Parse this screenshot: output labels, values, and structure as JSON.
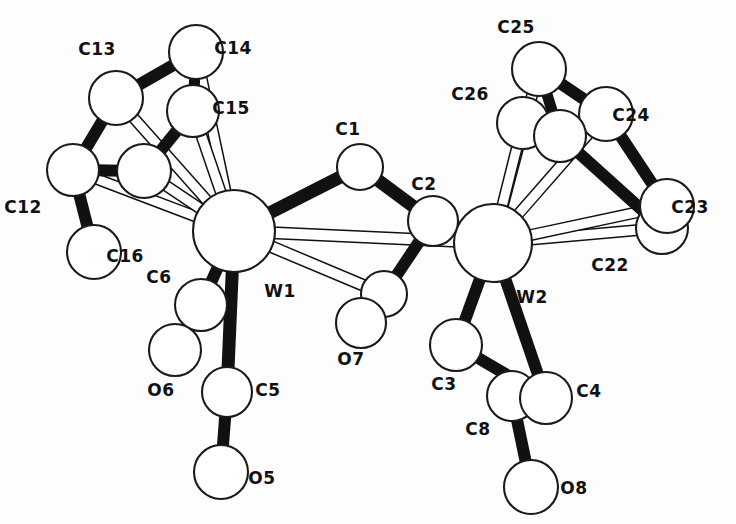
{
  "figure": {
    "background_color": "#fdfdfd",
    "line_color": "#111111",
    "atom_fill_color": "#ffffff",
    "width": 736,
    "height": 524
  },
  "chart_data": {
    "type": "diagram",
    "title": "",
    "atoms": [
      {
        "id": "W1",
        "label": "W1",
        "x": 234,
        "y": 231,
        "r": 41,
        "label_x": 280,
        "label_y": 297,
        "element": "W"
      },
      {
        "id": "W2",
        "label": "W2",
        "x": 493,
        "y": 243,
        "r": 39,
        "label_x": 532,
        "label_y": 303,
        "element": "W"
      },
      {
        "id": "C1",
        "label": "C1",
        "x": 360,
        "y": 167,
        "r": 23,
        "label_x": 348,
        "label_y": 135,
        "element": "C"
      },
      {
        "id": "C2",
        "label": "C2",
        "x": 433,
        "y": 221,
        "r": 25,
        "label_x": 424,
        "label_y": 190,
        "element": "C"
      },
      {
        "id": "C7",
        "label": "",
        "x": 384,
        "y": 294,
        "r": 23,
        "label_x": 0,
        "label_y": 0,
        "element": "C"
      },
      {
        "id": "O7",
        "label": "O7",
        "x": 361,
        "y": 323,
        "r": 25,
        "label_x": 351,
        "label_y": 365,
        "element": "O"
      },
      {
        "id": "C5",
        "label": "C5",
        "x": 227,
        "y": 392,
        "r": 25,
        "label_x": 268,
        "label_y": 396,
        "element": "C"
      },
      {
        "id": "O5",
        "label": "O5",
        "x": 221,
        "y": 472,
        "r": 27,
        "label_x": 262,
        "label_y": 484,
        "element": "O"
      },
      {
        "id": "C6",
        "label": "C6",
        "x": 201,
        "y": 305,
        "r": 26,
        "label_x": 159,
        "label_y": 283,
        "element": "C"
      },
      {
        "id": "O6",
        "label": "O6",
        "x": 175,
        "y": 350,
        "r": 26,
        "label_x": 161,
        "label_y": 396,
        "element": "O"
      },
      {
        "id": "C3",
        "label": "C3",
        "x": 456,
        "y": 345,
        "r": 26,
        "label_x": 444,
        "label_y": 390,
        "element": "C"
      },
      {
        "id": "C8",
        "label": "C8",
        "x": 512,
        "y": 396,
        "r": 25,
        "label_x": 478,
        "label_y": 435,
        "element": "C"
      },
      {
        "id": "C4",
        "label": "C4",
        "x": 546,
        "y": 398,
        "r": 26,
        "label_x": 589,
        "label_y": 397,
        "element": "C"
      },
      {
        "id": "O8",
        "label": "O8",
        "x": 531,
        "y": 487,
        "r": 27,
        "label_x": 574,
        "label_y": 494,
        "element": "O"
      },
      {
        "id": "C12",
        "label": "C12",
        "x": 73,
        "y": 170,
        "r": 26,
        "label_x": 23,
        "label_y": 213,
        "element": "C"
      },
      {
        "id": "C13",
        "label": "C13",
        "x": 116,
        "y": 98,
        "r": 27,
        "label_x": 97,
        "label_y": 55,
        "element": "C"
      },
      {
        "id": "C14",
        "label": "C14",
        "x": 196,
        "y": 52,
        "r": 27,
        "label_x": 233,
        "label_y": 54,
        "element": "C"
      },
      {
        "id": "C15",
        "label": "C15",
        "x": 193,
        "y": 111,
        "r": 26,
        "label_x": 231,
        "label_y": 114,
        "element": "C"
      },
      {
        "id": "C16",
        "label": "C16",
        "x": 144,
        "y": 171,
        "r": 27,
        "label_x": 125,
        "label_y": 262,
        "element": "C"
      },
      {
        "id": "C16b",
        "label": "",
        "x": 94,
        "y": 252,
        "r": 27,
        "label_x": 0,
        "label_y": 0,
        "element": "C"
      },
      {
        "id": "C22",
        "label": "C22",
        "x": 662,
        "y": 228,
        "r": 26,
        "label_x": 610,
        "label_y": 271,
        "element": "C"
      },
      {
        "id": "C23",
        "label": "C23",
        "x": 667,
        "y": 206,
        "r": 27,
        "label_x": 690,
        "label_y": 213,
        "element": "C"
      },
      {
        "id": "C24",
        "label": "C24",
        "x": 606,
        "y": 114,
        "r": 27,
        "label_x": 631,
        "label_y": 121,
        "element": "C"
      },
      {
        "id": "C25",
        "label": "C25",
        "x": 539,
        "y": 69,
        "r": 27,
        "label_x": 516,
        "label_y": 33,
        "element": "C"
      },
      {
        "id": "C26",
        "label": "C26",
        "x": 523,
        "y": 123,
        "r": 26,
        "label_x": 470,
        "label_y": 100,
        "element": "C"
      },
      {
        "id": "C26b",
        "label": "",
        "x": 560,
        "y": 136,
        "r": 26,
        "label_x": 0,
        "label_y": 0,
        "element": "C"
      }
    ],
    "bonds_solid": [
      {
        "from": "W1",
        "to": "C1",
        "w": 13
      },
      {
        "from": "C1",
        "to": "C2",
        "w": 13
      },
      {
        "from": "C2",
        "to": "W2",
        "w": 11
      },
      {
        "from": "C2",
        "to": "C7",
        "w": 12
      },
      {
        "from": "W1",
        "to": "C5",
        "w": 13
      },
      {
        "from": "C5",
        "to": "O5",
        "w": 12
      },
      {
        "from": "W1",
        "to": "C6",
        "w": 12
      },
      {
        "from": "C6",
        "to": "O6",
        "w": 12
      },
      {
        "from": "W2",
        "to": "C3",
        "w": 12
      },
      {
        "from": "C3",
        "to": "C4",
        "w": 12
      },
      {
        "from": "W2",
        "to": "C4",
        "w": 12
      },
      {
        "from": "C8",
        "to": "O8",
        "w": 12
      },
      {
        "from": "C13",
        "to": "C14",
        "w": 12
      },
      {
        "from": "C13",
        "to": "C12",
        "w": 12
      },
      {
        "from": "C14",
        "to": "C15",
        "w": 11
      },
      {
        "from": "C15",
        "to": "C16",
        "w": 12
      },
      {
        "from": "C12",
        "to": "C16",
        "w": 12
      },
      {
        "from": "C12",
        "to": "C16b",
        "w": 12
      },
      {
        "from": "C25",
        "to": "C24",
        "w": 12
      },
      {
        "from": "C25",
        "to": "C26b",
        "w": 11
      },
      {
        "from": "C24",
        "to": "C23",
        "w": 12
      },
      {
        "from": "C26b",
        "to": "C22",
        "w": 12
      }
    ],
    "bonds_open": [
      {
        "from": "W1",
        "to": "W2",
        "w": 10
      },
      {
        "from": "W1",
        "to": "C7",
        "w": 10
      },
      {
        "from": "W1",
        "to": "C12",
        "w": 9
      },
      {
        "from": "W1",
        "to": "C13",
        "w": 9
      },
      {
        "from": "W1",
        "to": "C14",
        "w": 9
      },
      {
        "from": "W1",
        "to": "C15",
        "w": 9
      },
      {
        "from": "W1",
        "to": "C16",
        "w": 9
      },
      {
        "from": "W2",
        "to": "C22",
        "w": 9
      },
      {
        "from": "W2",
        "to": "C23",
        "w": 9
      },
      {
        "from": "W2",
        "to": "C24",
        "w": 9
      },
      {
        "from": "W2",
        "to": "C25",
        "w": 9
      },
      {
        "from": "W2",
        "to": "C26",
        "w": 9
      },
      {
        "from": "W2",
        "to": "C3",
        "w": 7
      }
    ],
    "labels": [
      "C13",
      "C14",
      "C15",
      "C12",
      "C16",
      "C6",
      "O6",
      "C5",
      "O5",
      "W1",
      "C1",
      "C2",
      "O7",
      "W2",
      "C3",
      "C8",
      "C4",
      "O8",
      "C25",
      "C26",
      "C24",
      "C23",
      "C22"
    ]
  }
}
